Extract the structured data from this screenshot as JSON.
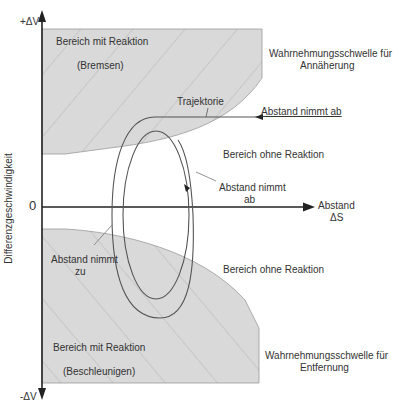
{
  "axes": {
    "y_top_label": "+ΔV",
    "y_bottom_label": "-ΔV",
    "y_title": "Differenzgeschwindigkeit",
    "origin_label": "0",
    "x_title_line1": "Abstand",
    "x_title_line2": "ΔS"
  },
  "regions": {
    "upper_reaction": {
      "line1": "Bereich mit Reaktion",
      "line2": "(Bremsen)"
    },
    "lower_reaction": {
      "line1": "Bereich mit Reaktion",
      "line2": "(Beschleunigen)"
    },
    "upper_no_reaction": "Bereich ohne Reaktion",
    "lower_no_reaction": "Bereich ohne Reaktion"
  },
  "thresholds": {
    "approach": {
      "line1": "Wahrnehmungsschwelle für",
      "line2": "Annäherung"
    },
    "removal": {
      "line1": "Wahrnehmungsschwelle für",
      "line2": "Entfernung"
    }
  },
  "annotations": {
    "trajectory": "Trajektorie",
    "distance_decreasing_top": "Abstand nimmt ab",
    "distance_decreasing_mid_line1": "Abstand nimmt",
    "distance_decreasing_mid_line2": "ab",
    "distance_increasing_line1": "Abstand nimmt",
    "distance_increasing_line2": "zu"
  },
  "colors": {
    "region_fill": "#d9d9d9",
    "hatch": "#b8b8b8",
    "axis": "#222222",
    "curve": "#555555"
  }
}
